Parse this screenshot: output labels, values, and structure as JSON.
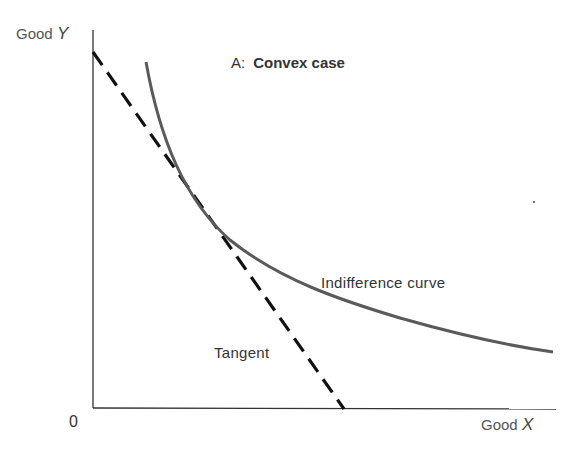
{
  "figure": {
    "panel_prefix": "A:",
    "panel_title": "Convex case",
    "y_axis_label": "Good",
    "y_axis_var": "Y",
    "x_axis_label": "Good",
    "x_axis_var": "X",
    "origin_label": "0",
    "curve_label": "Indifference curve",
    "tangent_label": "Tangent",
    "colors": {
      "axis": "#333333",
      "curve": "#555555",
      "tangent": "#111111",
      "text": "#444444"
    }
  }
}
